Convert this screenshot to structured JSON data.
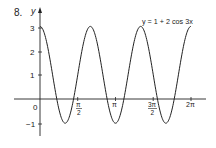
{
  "problem_number": "8.",
  "chart_data": {
    "type": "line",
    "title": "",
    "equation_label": "y = 1 + 2 cos 3x",
    "xlabel": "",
    "ylabel": "y",
    "xlim": [
      0,
      6.2832
    ],
    "ylim": [
      -1,
      3
    ],
    "grid": false,
    "legend": "none",
    "x_ticks": [
      {
        "label": "0",
        "value": 0
      },
      {
        "label": "π/2",
        "value": 1.5708
      },
      {
        "label": "π",
        "value": 3.1416
      },
      {
        "label": "3π/2",
        "value": 4.7124
      },
      {
        "label": "2π",
        "value": 6.2832
      }
    ],
    "y_ticks": [
      {
        "label": "-1",
        "value": -1
      },
      {
        "label": "1",
        "value": 1
      },
      {
        "label": "2",
        "value": 2
      },
      {
        "label": "3",
        "value": 3
      }
    ],
    "series": [
      {
        "name": "y = 1 + 2cos3x",
        "function": "1 + 2*cos(3*x)",
        "x": [
          0,
          0.5236,
          1.0472,
          1.5708,
          2.0944,
          2.618,
          3.1416,
          3.6652,
          4.1888,
          4.7124,
          5.236,
          5.7596,
          6.2832
        ],
        "values": [
          3,
          1,
          -1,
          1,
          3,
          1,
          -1,
          1,
          3,
          1,
          -1,
          1,
          3
        ]
      }
    ],
    "maxima": [
      [
        0,
        3
      ],
      [
        2.0944,
        3
      ],
      [
        4.1888,
        3
      ],
      [
        6.2832,
        3
      ]
    ],
    "minima": [
      [
        1.0472,
        -1
      ],
      [
        3.1416,
        -1
      ],
      [
        5.236,
        -1
      ]
    ]
  },
  "labels": {
    "x0": "0",
    "xpi": "π",
    "x2pi": "2π",
    "xpi2_num": "π",
    "xpi2_den": "2",
    "x3pi2_num": "3π",
    "x3pi2_den": "2",
    "y3": "3",
    "y2": "2",
    "y1": "1",
    "ym1": "−1",
    "yaxis": "y",
    "equation": "y = 1 + 2 cos 3x"
  },
  "colors": {
    "curve": "#222222",
    "axes": "#222222",
    "background": "#ffffff"
  }
}
